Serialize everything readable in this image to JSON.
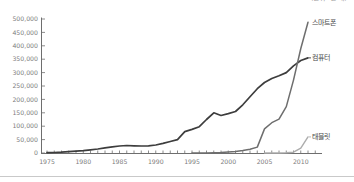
{
  "unit_note_clipped": "(단위: 천 대)",
  "colors": {
    "background": "#ffffff",
    "axis": "#6e6e6e",
    "tick_text": "#7d7d7d",
    "series_label_text": "#4a4a4a",
    "divider": "#c9c9c9",
    "computer_line": "#3d3d3d",
    "smartphone_line": "#6e6e6e",
    "tablet_line": "#adadad"
  },
  "chart_data": {
    "type": "line",
    "grid": false,
    "legend_position": "line-end-labels-right",
    "x_axis": {
      "label_years": [
        1975,
        1980,
        1985,
        1990,
        1995,
        2000,
        2005,
        2010
      ],
      "tick_start": 1975,
      "tick_end": 2012,
      "range": [
        1975,
        2012
      ]
    },
    "y_axis": {
      "ticks": [
        0,
        50000,
        100000,
        150000,
        200000,
        250000,
        300000,
        350000,
        400000,
        450000,
        500000
      ],
      "range": [
        0,
        500000
      ],
      "tick_format": "comma"
    },
    "series": [
      {
        "id": "smartphone",
        "label": "스마트폰",
        "color": "#6e6e6e",
        "width": 1.5,
        "leader": false,
        "start_year": 1995,
        "values": [
          0,
          0,
          0,
          1000,
          2000,
          4000,
          6000,
          9000,
          14000,
          22000,
          90000,
          113000,
          126000,
          173000,
          272000,
          390000,
          488000
        ]
      },
      {
        "id": "computer",
        "label": "컴퓨터",
        "color": "#3d3d3d",
        "width": 1.7,
        "leader": true,
        "start_year": 1975,
        "values": [
          1000,
          2000,
          3000,
          5000,
          7000,
          9000,
          12000,
          15000,
          19000,
          23000,
          26000,
          28000,
          27000,
          26000,
          27000,
          30000,
          36000,
          43000,
          50000,
          80000,
          88000,
          98000,
          125000,
          150000,
          140000,
          147000,
          155000,
          180000,
          210000,
          240000,
          263000,
          278000,
          288000,
          300000,
          325000,
          345000,
          355000
        ]
      },
      {
        "id": "tablet",
        "label": "태블릿",
        "color": "#adadad",
        "width": 1.4,
        "leader": true,
        "start_year": 2005,
        "values": [
          0,
          0,
          0,
          1000,
          3000,
          18000,
          60000
        ]
      }
    ]
  }
}
